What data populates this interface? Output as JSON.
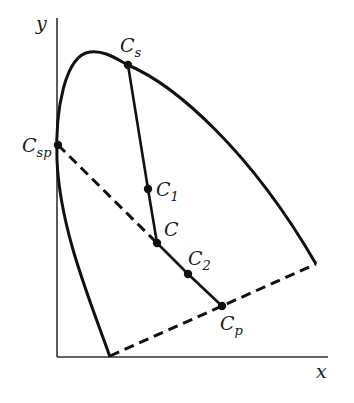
{
  "diagram": {
    "type": "chromaticity-diagram",
    "axes": {
      "x_label": "x",
      "y_label": "y"
    },
    "colors": {
      "stroke": "#111111",
      "background": "#ffffff"
    },
    "points": [
      {
        "id": "Cs",
        "main": "C",
        "sub": "s",
        "role": "spectral color on locus"
      },
      {
        "id": "Csp",
        "main": "C",
        "sub": "sp",
        "role": "spectral point on locus"
      },
      {
        "id": "C1",
        "main": "C",
        "sub": "1",
        "role": "intermediate point"
      },
      {
        "id": "C",
        "main": "C",
        "sub": "",
        "role": "reference point"
      },
      {
        "id": "C2",
        "main": "C",
        "sub": "2",
        "role": "intermediate point"
      },
      {
        "id": "Cp",
        "main": "C",
        "sub": "p",
        "role": "point on purple line"
      }
    ],
    "lines": [
      {
        "from": "Cs",
        "to": "C",
        "style": "solid"
      },
      {
        "from": "C",
        "to": "Cp",
        "style": "solid"
      },
      {
        "from": "Csp",
        "to": "C",
        "style": "dashed"
      },
      {
        "from": "purple-line-start",
        "to": "purple-line-end",
        "style": "dashed",
        "name": "purple line"
      }
    ]
  }
}
